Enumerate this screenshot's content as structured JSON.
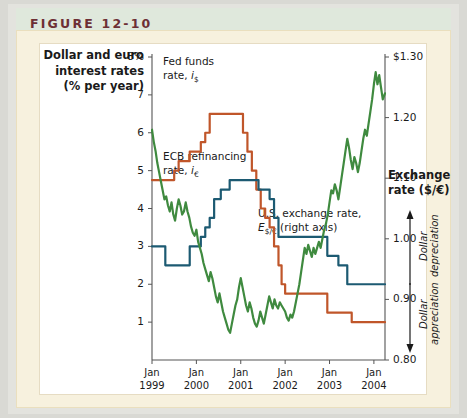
{
  "header": {
    "figure_label": "FIGURE 12-10"
  },
  "colors": {
    "fed_funds": "#c0562a",
    "ecb_rate": "#1c5a72",
    "exchange_rate": "#3f8a3f",
    "header_band": "#dfe8dc",
    "header_text": "#6d2f35",
    "panel": "#f7f1de",
    "plot_background": "#ffffff",
    "axis": "#555555"
  },
  "chart_data": {
    "type": "line",
    "title": "",
    "xlabel": "",
    "ylabel": "Dollar and euro interest rates (% per year)",
    "y2label": "Exchange rate ($/€)",
    "grid": false,
    "legend": "inline-annotations",
    "x_tick_labels": [
      {
        "line1": "Jan",
        "line2": "1999"
      },
      {
        "line1": "Jan",
        "line2": "2000"
      },
      {
        "line1": "Jan",
        "line2": "2001"
      },
      {
        "line1": "Jan",
        "line2": "2002"
      },
      {
        "line1": "Jan",
        "line2": "2003"
      },
      {
        "line1": "Jan",
        "line2": "2004"
      }
    ],
    "xlim": [
      1999.0,
      2004.25
    ],
    "left_axis": {
      "ticks": [
        "8%",
        "7",
        "6",
        "5",
        "4",
        "3",
        "2",
        "1"
      ],
      "tick_values": [
        8,
        7,
        6,
        5,
        4,
        3,
        2,
        1
      ],
      "ylim": [
        0,
        8
      ]
    },
    "right_axis": {
      "ticks": [
        "$1.30",
        "1.20",
        "1.10",
        "1.00",
        "0.90",
        "0.80"
      ],
      "tick_values": [
        1.3,
        1.2,
        1.1,
        1.0,
        0.9,
        0.8
      ],
      "ylim": [
        0.8,
        1.3
      ]
    },
    "annotations": [
      {
        "name": "dollar-depreciation",
        "text": "Dollar depreciation",
        "direction": "up"
      },
      {
        "name": "dollar-appreciation",
        "text": "Dollar appreciation",
        "direction": "down"
      }
    ],
    "series": [
      {
        "name": "Fed funds rate",
        "label_line1": "Fed funds",
        "label_line2_prefix": "rate, ",
        "label_symbol": "i",
        "label_subscript": "$",
        "axis": "left",
        "color": "#c0562a",
        "points": [
          [
            1999.0,
            4.75
          ],
          [
            1999.25,
            4.75
          ],
          [
            1999.5,
            5.0
          ],
          [
            1999.6,
            5.25
          ],
          [
            1999.75,
            5.25
          ],
          [
            1999.85,
            5.5
          ],
          [
            2000.0,
            5.5
          ],
          [
            2000.1,
            5.75
          ],
          [
            2000.2,
            6.0
          ],
          [
            2000.3,
            6.5
          ],
          [
            2000.45,
            6.5
          ],
          [
            2000.75,
            6.5
          ],
          [
            2001.0,
            6.5
          ],
          [
            2001.05,
            6.0
          ],
          [
            2001.15,
            5.5
          ],
          [
            2001.25,
            5.0
          ],
          [
            2001.35,
            4.5
          ],
          [
            2001.45,
            4.0
          ],
          [
            2001.55,
            3.75
          ],
          [
            2001.65,
            3.5
          ],
          [
            2001.75,
            3.0
          ],
          [
            2001.85,
            2.5
          ],
          [
            2001.92,
            2.0
          ],
          [
            2002.0,
            1.75
          ],
          [
            2002.5,
            1.75
          ],
          [
            2002.9,
            1.75
          ],
          [
            2002.95,
            1.25
          ],
          [
            2003.0,
            1.25
          ],
          [
            2003.45,
            1.25
          ],
          [
            2003.5,
            1.0
          ],
          [
            2004.0,
            1.0
          ],
          [
            2004.25,
            1.0
          ]
        ]
      },
      {
        "name": "ECB refinancing rate",
        "label_line1": "ECB refinancing",
        "label_line2_prefix": "rate, ",
        "label_symbol": "i",
        "label_subscript": "€",
        "axis": "left",
        "color": "#1c5a72",
        "points": [
          [
            1999.0,
            3.0
          ],
          [
            1999.25,
            3.0
          ],
          [
            1999.3,
            2.5
          ],
          [
            1999.5,
            2.5
          ],
          [
            1999.8,
            2.5
          ],
          [
            1999.85,
            3.0
          ],
          [
            2000.0,
            3.0
          ],
          [
            2000.1,
            3.25
          ],
          [
            2000.2,
            3.5
          ],
          [
            2000.3,
            3.75
          ],
          [
            2000.4,
            4.25
          ],
          [
            2000.55,
            4.5
          ],
          [
            2000.75,
            4.75
          ],
          [
            2001.0,
            4.75
          ],
          [
            2001.3,
            4.75
          ],
          [
            2001.4,
            4.5
          ],
          [
            2001.55,
            4.5
          ],
          [
            2001.65,
            4.25
          ],
          [
            2001.75,
            3.75
          ],
          [
            2001.85,
            3.25
          ],
          [
            2002.0,
            3.25
          ],
          [
            2002.5,
            3.25
          ],
          [
            2002.9,
            3.25
          ],
          [
            2002.95,
            2.75
          ],
          [
            2003.0,
            2.75
          ],
          [
            2003.2,
            2.5
          ],
          [
            2003.4,
            2.0
          ],
          [
            2003.6,
            2.0
          ],
          [
            2004.0,
            2.0
          ],
          [
            2004.25,
            2.0
          ]
        ]
      },
      {
        "name": "U.S. exchange rate",
        "label_line1": "U.S. exchange rate,",
        "label_symbol": "E",
        "label_subscript": "$/€",
        "label_line2_suffix": " (right axis)",
        "axis": "right",
        "color": "#3f8a3f",
        "points": [
          [
            1999.0,
            1.18
          ],
          [
            1999.04,
            1.16
          ],
          [
            1999.08,
            1.145
          ],
          [
            1999.12,
            1.125
          ],
          [
            1999.16,
            1.11
          ],
          [
            1999.2,
            1.095
          ],
          [
            1999.24,
            1.08
          ],
          [
            1999.28,
            1.065
          ],
          [
            1999.32,
            1.07
          ],
          [
            1999.36,
            1.055
          ],
          [
            1999.4,
            1.045
          ],
          [
            1999.44,
            1.06
          ],
          [
            1999.48,
            1.04
          ],
          [
            1999.52,
            1.03
          ],
          [
            1999.56,
            1.05
          ],
          [
            1999.6,
            1.065
          ],
          [
            1999.64,
            1.055
          ],
          [
            1999.68,
            1.04
          ],
          [
            1999.72,
            1.045
          ],
          [
            1999.76,
            1.06
          ],
          [
            1999.8,
            1.045
          ],
          [
            1999.84,
            1.035
          ],
          [
            1999.88,
            1.02
          ],
          [
            1999.92,
            1.01
          ],
          [
            1999.96,
            1.005
          ],
          [
            2000.0,
            1.015
          ],
          [
            2000.04,
            0.995
          ],
          [
            2000.08,
            0.985
          ],
          [
            2000.12,
            0.975
          ],
          [
            2000.16,
            0.96
          ],
          [
            2000.2,
            0.95
          ],
          [
            2000.24,
            0.94
          ],
          [
            2000.28,
            0.93
          ],
          [
            2000.32,
            0.945
          ],
          [
            2000.36,
            0.935
          ],
          [
            2000.4,
            0.92
          ],
          [
            2000.44,
            0.905
          ],
          [
            2000.48,
            0.895
          ],
          [
            2000.52,
            0.91
          ],
          [
            2000.56,
            0.895
          ],
          [
            2000.6,
            0.88
          ],
          [
            2000.64,
            0.87
          ],
          [
            2000.68,
            0.86
          ],
          [
            2000.72,
            0.85
          ],
          [
            2000.76,
            0.845
          ],
          [
            2000.8,
            0.86
          ],
          [
            2000.84,
            0.875
          ],
          [
            2000.88,
            0.89
          ],
          [
            2000.92,
            0.9
          ],
          [
            2000.96,
            0.92
          ],
          [
            2001.0,
            0.935
          ],
          [
            2001.04,
            0.92
          ],
          [
            2001.08,
            0.905
          ],
          [
            2001.12,
            0.89
          ],
          [
            2001.16,
            0.88
          ],
          [
            2001.2,
            0.895
          ],
          [
            2001.24,
            0.885
          ],
          [
            2001.28,
            0.87
          ],
          [
            2001.32,
            0.86
          ],
          [
            2001.36,
            0.855
          ],
          [
            2001.4,
            0.865
          ],
          [
            2001.44,
            0.88
          ],
          [
            2001.48,
            0.87
          ],
          [
            2001.52,
            0.86
          ],
          [
            2001.56,
            0.875
          ],
          [
            2001.6,
            0.89
          ],
          [
            2001.64,
            0.905
          ],
          [
            2001.68,
            0.895
          ],
          [
            2001.72,
            0.885
          ],
          [
            2001.76,
            0.9
          ],
          [
            2001.8,
            0.89
          ],
          [
            2001.84,
            0.885
          ],
          [
            2001.88,
            0.895
          ],
          [
            2001.92,
            0.89
          ],
          [
            2001.96,
            0.885
          ],
          [
            2002.0,
            0.88
          ],
          [
            2002.04,
            0.87
          ],
          [
            2002.08,
            0.865
          ],
          [
            2002.12,
            0.875
          ],
          [
            2002.16,
            0.87
          ],
          [
            2002.2,
            0.88
          ],
          [
            2002.24,
            0.895
          ],
          [
            2002.28,
            0.91
          ],
          [
            2002.32,
            0.925
          ],
          [
            2002.36,
            0.945
          ],
          [
            2002.4,
            0.965
          ],
          [
            2002.44,
            0.985
          ],
          [
            2002.48,
            0.975
          ],
          [
            2002.52,
            0.99
          ],
          [
            2002.56,
            0.98
          ],
          [
            2002.6,
            0.97
          ],
          [
            2002.64,
            0.985
          ],
          [
            2002.68,
            0.975
          ],
          [
            2002.72,
            0.985
          ],
          [
            2002.76,
            0.995
          ],
          [
            2002.8,
            0.985
          ],
          [
            2002.84,
            1.0
          ],
          [
            2002.88,
            1.015
          ],
          [
            2002.92,
            1.025
          ],
          [
            2002.96,
            1.04
          ],
          [
            2003.0,
            1.06
          ],
          [
            2003.04,
            1.08
          ],
          [
            2003.08,
            1.075
          ],
          [
            2003.12,
            1.09
          ],
          [
            2003.16,
            1.08
          ],
          [
            2003.2,
            1.065
          ],
          [
            2003.24,
            1.085
          ],
          [
            2003.28,
            1.105
          ],
          [
            2003.32,
            1.125
          ],
          [
            2003.36,
            1.145
          ],
          [
            2003.4,
            1.165
          ],
          [
            2003.44,
            1.15
          ],
          [
            2003.48,
            1.13
          ],
          [
            2003.52,
            1.115
          ],
          [
            2003.56,
            1.135
          ],
          [
            2003.6,
            1.125
          ],
          [
            2003.64,
            1.11
          ],
          [
            2003.68,
            1.125
          ],
          [
            2003.72,
            1.145
          ],
          [
            2003.76,
            1.165
          ],
          [
            2003.8,
            1.18
          ],
          [
            2003.84,
            1.17
          ],
          [
            2003.88,
            1.19
          ],
          [
            2003.92,
            1.21
          ],
          [
            2003.96,
            1.23
          ],
          [
            2004.0,
            1.255
          ],
          [
            2004.04,
            1.275
          ],
          [
            2004.08,
            1.255
          ],
          [
            2004.12,
            1.27
          ],
          [
            2004.16,
            1.25
          ],
          [
            2004.2,
            1.23
          ],
          [
            2004.25,
            1.24
          ]
        ]
      }
    ]
  }
}
